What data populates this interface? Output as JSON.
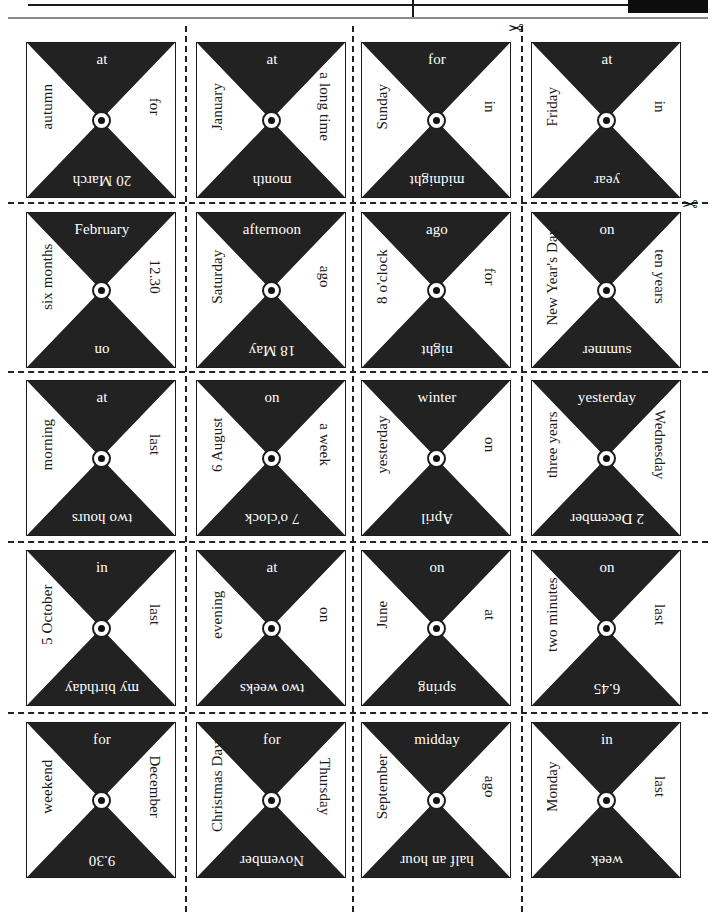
{
  "page": {
    "header": {
      "black_block_label": "",
      "divider_label": ""
    },
    "cut_marks": {
      "scissors_glyph": "✂",
      "scissors_top_name": "scissors-cut-mark-top",
      "scissors_right_name": "scissors-cut-mark-right"
    }
  },
  "grid": {
    "columns": 4,
    "rows": 5
  },
  "cards": [
    {
      "top": "at",
      "right": "for",
      "bottom": "20 March",
      "left": "autumn"
    },
    {
      "top": "at",
      "right": "a long time",
      "bottom": "month",
      "left": "January"
    },
    {
      "top": "for",
      "right": "in",
      "bottom": "midnight",
      "left": "Sunday"
    },
    {
      "top": "at",
      "right": "in",
      "bottom": "year",
      "left": "Friday"
    },
    {
      "top": "February",
      "right": "12.30",
      "bottom": "on",
      "left": "six months"
    },
    {
      "top": "afternoon",
      "right": "ago",
      "bottom": "18 May",
      "left": "Saturday"
    },
    {
      "top": "ago",
      "right": "for",
      "bottom": "night",
      "left": "8 o'clock"
    },
    {
      "top": "on",
      "right": "ten years",
      "bottom": "summer",
      "left": "New Year's Day"
    },
    {
      "top": "at",
      "right": "last",
      "bottom": "two hours",
      "left": "morning"
    },
    {
      "top": "on",
      "right": "a week",
      "bottom": "7 o'clock",
      "left": "6 August"
    },
    {
      "top": "winter",
      "right": "on",
      "bottom": "April",
      "left": "yesterday"
    },
    {
      "top": "yesterday",
      "right": "Wednesday",
      "bottom": "2 December",
      "left": "three years"
    },
    {
      "top": "in",
      "right": "last",
      "bottom": "my birthday",
      "left": "5 October"
    },
    {
      "top": "at",
      "right": "on",
      "bottom": "two weeks",
      "left": "evening"
    },
    {
      "top": "on",
      "right": "at",
      "bottom": "spring",
      "left": "June"
    },
    {
      "top": "on",
      "right": "last",
      "bottom": "6.45",
      "left": "two minutes"
    },
    {
      "top": "for",
      "right": "December",
      "bottom": "9.30",
      "left": "weekend"
    },
    {
      "top": "for",
      "right": "Thursday",
      "bottom": "November",
      "left": "Christmas Day"
    },
    {
      "top": "midday",
      "right": "ago",
      "bottom": "half an hour",
      "left": "September"
    },
    {
      "top": "in",
      "right": "last",
      "bottom": "week",
      "left": "Monday"
    }
  ],
  "colors": {
    "ink": "#222222",
    "paper": "#ffffff",
    "rule": "#1a1a1a"
  }
}
